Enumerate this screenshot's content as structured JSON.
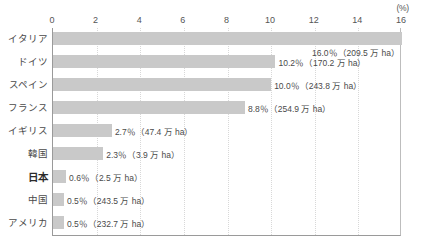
{
  "chart_data": {
    "type": "bar",
    "orientation": "horizontal",
    "title": "",
    "xlabel": "(%)",
    "ylabel": "",
    "xlim": [
      0,
      16
    ],
    "xticks": [
      0,
      2,
      4,
      6,
      8,
      10,
      12,
      14,
      16
    ],
    "grid": true,
    "legend": null,
    "categories": [
      "イタリア",
      "ドイツ",
      "スペイン",
      "フランス",
      "イギリス",
      "韓国",
      "日本",
      "中国",
      "アメリカ"
    ],
    "values": [
      16.0,
      10.2,
      10.0,
      8.8,
      2.7,
      2.3,
      0.6,
      0.5,
      0.5
    ],
    "data_labels": [
      "16.0％（209.5 万 ha）",
      "10.2％（170.2 万 ha）",
      "10.0％（243.8 万 ha）",
      "8.8％（254.9 万 ha）",
      "2.7％（47.4 万 ha）",
      "2.3％（3.9 万 ha）",
      "0.6％（2.5 万 ha）",
      "0.5％（243.5 万 ha）",
      "0.5％（232.7 万 ha）"
    ],
    "areas_man_ha": [
      209.5,
      170.2,
      243.8,
      254.9,
      47.4,
      3.9,
      2.5,
      243.5,
      232.7
    ],
    "label_placement": [
      "below",
      "right",
      "right",
      "right",
      "right",
      "right",
      "right",
      "right",
      "right"
    ],
    "highlight_category": "日本",
    "colors": {
      "bar": "#c9c9c9",
      "text": "#4a4a4a",
      "axis": "#9a9a9a",
      "grid": "#d8d8d8",
      "background": "#ffffff"
    }
  }
}
